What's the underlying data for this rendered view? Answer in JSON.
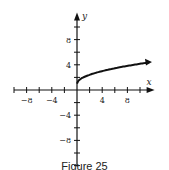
{
  "chart_data": {
    "type": "line",
    "title": "",
    "xlabel": "x",
    "ylabel": "y",
    "xlim": [
      -10,
      12
    ],
    "ylim": [
      -12,
      12
    ],
    "x_ticks": [
      -8,
      -4,
      4,
      8
    ],
    "y_ticks": [
      8,
      4,
      -4,
      -8
    ],
    "tick_step": 2,
    "series": [
      {
        "name": "y = sqrt(x) + 1",
        "x": [
          0,
          1,
          2,
          4,
          6,
          8,
          10,
          11.5
        ],
        "y": [
          1,
          2,
          2.41,
          3,
          3.45,
          3.83,
          4.16,
          4.39
        ],
        "end_arrow": true
      }
    ],
    "grid": false
  },
  "caption": "Figure 25"
}
